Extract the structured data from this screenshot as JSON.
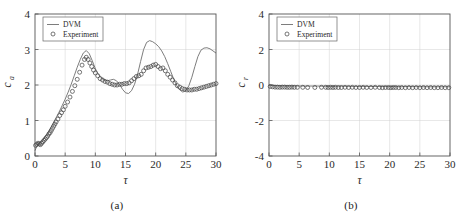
{
  "figure": {
    "panels": [
      {
        "caption": "(a)",
        "legend": {
          "line_label": "DVM",
          "marker_label": "Experiment",
          "position": "top-left"
        },
        "chart_data": {
          "type": "line",
          "title": "",
          "xlabel": "τ",
          "ylabel": "c_a",
          "ylabel_base": "c",
          "ylabel_sub": "a",
          "xlim": [
            0,
            30
          ],
          "ylim": [
            0,
            4
          ],
          "xticks": [
            0,
            5,
            10,
            15,
            20,
            25,
            30
          ],
          "yticks": [
            0,
            1,
            2,
            3,
            4
          ],
          "grid": true,
          "series": [
            {
              "name": "DVM",
              "style": "line",
              "color": "#6e6e6e",
              "x": [
                0.0,
                0.3,
                0.6,
                1.0,
                1.5,
                2.0,
                2.5,
                3.0,
                3.5,
                4.0,
                4.5,
                5.0,
                5.5,
                6.0,
                6.5,
                7.0,
                7.5,
                8.0,
                8.5,
                9.0,
                9.5,
                10.0,
                10.5,
                11.0,
                11.5,
                12.0,
                12.5,
                13.0,
                13.5,
                14.0,
                14.5,
                15.0,
                15.5,
                16.0,
                16.5,
                17.0,
                17.5,
                18.0,
                18.5,
                19.0,
                19.5,
                20.0,
                20.5,
                21.0,
                21.5,
                22.0,
                22.5,
                23.0,
                23.5,
                24.0,
                24.5,
                25.0,
                25.5,
                26.0,
                26.5,
                27.0,
                27.5,
                28.0,
                28.5,
                29.0,
                29.5,
                30.0
              ],
              "y": [
                0.15,
                0.28,
                0.34,
                0.4,
                0.5,
                0.62,
                0.76,
                0.92,
                1.08,
                1.24,
                1.42,
                1.6,
                1.8,
                2.02,
                2.26,
                2.5,
                2.72,
                2.9,
                2.97,
                2.88,
                2.68,
                2.46,
                2.3,
                2.2,
                2.14,
                2.12,
                2.14,
                2.16,
                2.12,
                2.02,
                1.88,
                1.78,
                1.76,
                1.84,
                2.02,
                2.3,
                2.66,
                3.0,
                3.2,
                3.25,
                3.22,
                3.16,
                3.08,
                2.96,
                2.8,
                2.6,
                2.38,
                2.16,
                1.98,
                1.86,
                1.8,
                1.84,
                1.98,
                2.22,
                2.52,
                2.8,
                2.98,
                3.04,
                3.05,
                3.02,
                2.96,
                2.9
              ]
            },
            {
              "name": "Experiment",
              "style": "markers",
              "color": "#4a4a4a",
              "x": [
                0.1,
                0.3,
                0.5,
                0.7,
                0.9,
                1.1,
                1.3,
                1.5,
                1.7,
                1.9,
                2.1,
                2.3,
                2.5,
                2.7,
                2.9,
                3.1,
                3.3,
                3.5,
                3.8,
                4.1,
                4.4,
                4.7,
                5.0,
                5.4,
                5.8,
                6.2,
                6.6,
                7.0,
                7.4,
                7.8,
                8.2,
                8.5,
                8.8,
                9.1,
                9.4,
                9.7,
                10.0,
                10.4,
                10.8,
                11.2,
                11.6,
                12.0,
                12.4,
                12.8,
                13.2,
                13.6,
                14.0,
                14.4,
                14.8,
                15.2,
                15.6,
                16.0,
                16.4,
                16.8,
                17.2,
                17.6,
                18.0,
                18.4,
                18.8,
                19.2,
                19.6,
                20.0,
                20.4,
                20.8,
                21.2,
                21.6,
                22.0,
                22.4,
                22.8,
                23.2,
                23.6,
                24.0,
                24.4,
                24.8,
                25.2,
                25.6,
                26.0,
                26.4,
                26.8,
                27.2,
                27.6,
                28.0,
                28.4,
                28.8,
                29.2,
                29.6,
                30.0
              ],
              "y": [
                0.3,
                0.33,
                0.36,
                0.34,
                0.32,
                0.36,
                0.4,
                0.44,
                0.48,
                0.52,
                0.56,
                0.62,
                0.66,
                0.72,
                0.78,
                0.84,
                0.9,
                0.96,
                1.04,
                1.14,
                1.22,
                1.3,
                1.4,
                1.52,
                1.66,
                1.82,
                1.98,
                2.16,
                2.36,
                2.56,
                2.72,
                2.78,
                2.72,
                2.62,
                2.52,
                2.42,
                2.34,
                2.26,
                2.18,
                2.14,
                2.1,
                2.08,
                2.04,
                2.02,
                2.0,
                2.0,
                2.02,
                2.02,
                2.04,
                2.04,
                2.06,
                2.12,
                2.18,
                2.24,
                2.26,
                2.3,
                2.4,
                2.48,
                2.5,
                2.52,
                2.56,
                2.58,
                2.52,
                2.46,
                2.48,
                2.4,
                2.3,
                2.22,
                2.14,
                2.06,
                1.98,
                1.94,
                1.9,
                1.88,
                1.86,
                1.86,
                1.86,
                1.88,
                1.88,
                1.9,
                1.92,
                1.94,
                1.96,
                1.98,
                2.0,
                2.02,
                2.04
              ]
            }
          ]
        }
      },
      {
        "caption": "(b)",
        "legend": {
          "line_label": "DVM",
          "marker_label": "Experiment",
          "position": "top-left"
        },
        "chart_data": {
          "type": "line",
          "title": "",
          "xlabel": "τ",
          "ylabel": "c_r",
          "ylabel_base": "c",
          "ylabel_sub": "r",
          "xlim": [
            0,
            30
          ],
          "ylim": [
            -4,
            4
          ],
          "xticks": [
            0,
            5,
            10,
            15,
            20,
            25,
            30
          ],
          "yticks": [
            -4,
            -2,
            0,
            2,
            4
          ],
          "grid": true,
          "series": [
            {
              "name": "DVM",
              "style": "line",
              "color": "#6e6e6e",
              "x": [
                0,
                2,
                4,
                6,
                8,
                10,
                12,
                14,
                16,
                18,
                20,
                22,
                24,
                26,
                28,
                30
              ],
              "y": [
                -0.02,
                -0.04,
                -0.05,
                -0.06,
                -0.06,
                -0.07,
                -0.07,
                -0.08,
                -0.08,
                -0.08,
                -0.09,
                -0.09,
                -0.09,
                -0.1,
                -0.1,
                -0.1
              ]
            },
            {
              "name": "Experiment",
              "style": "markers",
              "color": "#4a4a4a",
              "x": [
                0.2,
                0.6,
                1.0,
                1.4,
                1.8,
                2.2,
                2.6,
                3.0,
                3.4,
                3.8,
                4.2,
                4.7,
                5.6,
                6.4,
                7.6,
                8.7,
                9.4,
                9.8,
                10.2,
                10.6,
                11.0,
                11.5,
                12.0,
                12.6,
                13.2,
                13.8,
                14.4,
                15.0,
                15.6,
                16.2,
                16.9,
                17.6,
                18.3,
                18.8,
                19.3,
                19.8,
                20.2,
                20.6,
                21.0,
                21.5,
                22.0,
                22.6,
                23.2,
                23.8,
                24.4,
                25.0,
                25.6,
                26.2,
                26.8,
                27.4,
                28.0,
                28.6,
                29.2,
                29.8
              ],
              "y": [
                -0.08,
                -0.1,
                -0.12,
                -0.12,
                -0.13,
                -0.12,
                -0.12,
                -0.13,
                -0.13,
                -0.12,
                -0.13,
                -0.13,
                -0.13,
                -0.14,
                -0.14,
                -0.13,
                -0.13,
                -0.14,
                -0.13,
                -0.14,
                -0.13,
                -0.14,
                -0.14,
                -0.13,
                -0.14,
                -0.13,
                -0.14,
                -0.14,
                -0.13,
                -0.14,
                -0.14,
                -0.13,
                -0.14,
                -0.15,
                -0.14,
                -0.14,
                -0.15,
                -0.14,
                -0.14,
                -0.15,
                -0.14,
                -0.15,
                -0.14,
                -0.15,
                -0.14,
                -0.15,
                -0.14,
                -0.15,
                -0.14,
                -0.15,
                -0.15,
                -0.14,
                -0.15,
                -0.15
              ]
            }
          ]
        }
      }
    ]
  }
}
